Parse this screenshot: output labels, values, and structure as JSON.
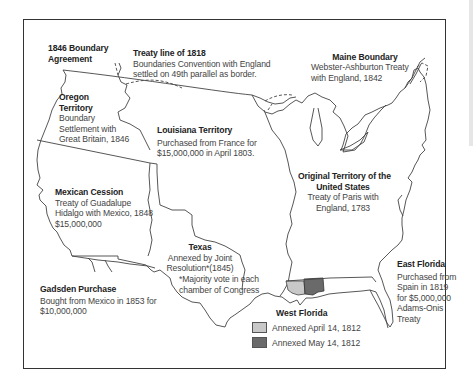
{
  "map": {
    "type": "historical territorial acquisitions map",
    "colors": {
      "outline": "#444444",
      "west_florida_april": "#c8c8c8",
      "west_florida_may": "#6a6a6a",
      "frame": "#333333"
    },
    "labels": {
      "boundary_1846": {
        "title": "1846 Boundary\nAgreement",
        "title_lines": [
          "1846 Boundary",
          "Agreement"
        ]
      },
      "treaty_1818": {
        "title": "Treaty line of 1818",
        "lines": [
          "Boundaries Convention with England",
          "settled on 49th parallel as border."
        ]
      },
      "maine": {
        "title": "Maine Boundary",
        "lines": [
          "Webster-Ashburton Treaty",
          "with England, 1842"
        ]
      },
      "oregon": {
        "title_lines": [
          "Oregon",
          "Territory"
        ],
        "lines": [
          "Boundary",
          "Settlement with",
          "Great Britain, 1846"
        ]
      },
      "louisiana": {
        "title": "Louisiana Territory",
        "lines": [
          "Purchased from France for",
          "$15,000,000 in April 1803."
        ]
      },
      "original": {
        "title_lines": [
          "Original Territory of the",
          "United States"
        ],
        "lines": [
          "Treaty of Paris with",
          "England, 1783"
        ]
      },
      "mexican_cession": {
        "title": "Mexican Cession",
        "lines": [
          "Treaty of Guadalupe",
          "Hidalgo with Mexico, 1848",
          "$15,000,000"
        ]
      },
      "texas": {
        "title": "Texas",
        "lines": [
          "Annexed by Joint",
          "Resolution*(1845)"
        ],
        "note": [
          "*Majority vote in each",
          "chamber of Congress"
        ]
      },
      "gadsden": {
        "title": "Gadsden Purchase",
        "lines": [
          "Bought from Mexico in 1853 for",
          "$10,000,000"
        ]
      },
      "east_florida": {
        "title": "East Florida",
        "lines": [
          "Purchased from",
          "Spain in 1819",
          "for $5,000,000",
          "Adams-Onis",
          "Treaty"
        ]
      }
    },
    "legend": {
      "title": "West Florida",
      "items": [
        {
          "label": "Annexed April 14, 1812",
          "color": "#c8c8c8"
        },
        {
          "label": "Annexed May 14, 1812",
          "color": "#6a6a6a"
        }
      ]
    }
  }
}
